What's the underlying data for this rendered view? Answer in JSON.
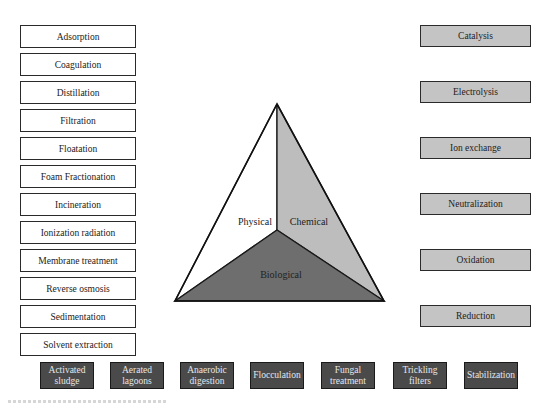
{
  "diagram": {
    "type": "treatment-methods-classification",
    "center": {
      "shape": "triangle",
      "sections": [
        {
          "label": "Physical",
          "color": "#ffffff"
        },
        {
          "label": "Chemical",
          "color": "#bdbdbd"
        },
        {
          "label": "Biological",
          "color": "#6e6e6e"
        }
      ]
    },
    "physical_methods": [
      "Adsorption",
      "Coagulation",
      "Distillation",
      "Filtration",
      "Floatation",
      "Foam Fractionation",
      "Incineration",
      "Ionization radiation",
      "Membrane treatment",
      "Reverse osmosis",
      "Sedimentation",
      "Solvent extraction"
    ],
    "chemical_methods": [
      "Catalysis",
      "Electrolysis",
      "Ion exchange",
      "Neutralization",
      "Oxidation",
      "Reduction"
    ],
    "biological_methods": [
      "Activated sludge",
      "Aerated lagoons",
      "Anaerobic digestion",
      "Flocculation",
      "Fungal treatment",
      "Trickling filters",
      "Stabilization"
    ],
    "colors": {
      "physical_box_fill": "#ffffff",
      "chemical_box_fill": "#c4c4c4",
      "biological_box_fill": "#4a4a4a",
      "biological_text": "#e6e6e6",
      "border": "#2a2a2a"
    }
  }
}
